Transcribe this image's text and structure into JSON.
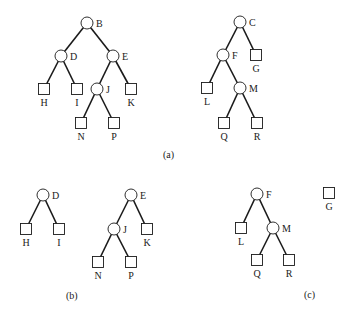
{
  "figure": {
    "panels": [
      {
        "caption": "(a)",
        "trees": [
          {
            "root": "B",
            "nodes": [
              {
                "id": "B",
                "kind": "internal",
                "children": [
                  "D",
                  "E"
                ]
              },
              {
                "id": "D",
                "kind": "internal",
                "children": [
                  "H",
                  "I"
                ]
              },
              {
                "id": "E",
                "kind": "internal",
                "children": [
                  "J",
                  "K"
                ]
              },
              {
                "id": "H",
                "kind": "leaf"
              },
              {
                "id": "I",
                "kind": "leaf"
              },
              {
                "id": "J",
                "kind": "internal",
                "children": [
                  "N",
                  "P"
                ]
              },
              {
                "id": "K",
                "kind": "leaf"
              },
              {
                "id": "N",
                "kind": "leaf"
              },
              {
                "id": "P",
                "kind": "leaf"
              }
            ]
          },
          {
            "root": "C",
            "nodes": [
              {
                "id": "C",
                "kind": "internal",
                "children": [
                  "F",
                  "G"
                ]
              },
              {
                "id": "F",
                "kind": "internal",
                "children": [
                  "L",
                  "M"
                ]
              },
              {
                "id": "G",
                "kind": "leaf"
              },
              {
                "id": "L",
                "kind": "leaf"
              },
              {
                "id": "M",
                "kind": "internal",
                "children": [
                  "Q",
                  "R"
                ]
              },
              {
                "id": "Q",
                "kind": "leaf"
              },
              {
                "id": "R",
                "kind": "leaf"
              }
            ]
          }
        ]
      },
      {
        "caption": "(b)",
        "trees": [
          {
            "root": "D",
            "nodes": [
              {
                "id": "D",
                "kind": "internal",
                "children": [
                  "H",
                  "I"
                ]
              },
              {
                "id": "H",
                "kind": "leaf"
              },
              {
                "id": "I",
                "kind": "leaf"
              }
            ]
          },
          {
            "root": "E",
            "nodes": [
              {
                "id": "E",
                "kind": "internal",
                "children": [
                  "J",
                  "K"
                ]
              },
              {
                "id": "J",
                "kind": "internal",
                "children": [
                  "N",
                  "P"
                ]
              },
              {
                "id": "K",
                "kind": "leaf"
              },
              {
                "id": "N",
                "kind": "leaf"
              },
              {
                "id": "P",
                "kind": "leaf"
              }
            ]
          }
        ]
      },
      {
        "caption": "(c)",
        "trees": [
          {
            "root": "F",
            "nodes": [
              {
                "id": "F",
                "kind": "internal",
                "children": [
                  "L",
                  "M"
                ]
              },
              {
                "id": "L",
                "kind": "leaf"
              },
              {
                "id": "M",
                "kind": "internal",
                "children": [
                  "Q",
                  "R"
                ]
              },
              {
                "id": "Q",
                "kind": "leaf"
              },
              {
                "id": "R",
                "kind": "leaf"
              }
            ]
          },
          {
            "root": "G",
            "nodes": [
              {
                "id": "G",
                "kind": "leaf"
              }
            ]
          }
        ]
      }
    ]
  }
}
